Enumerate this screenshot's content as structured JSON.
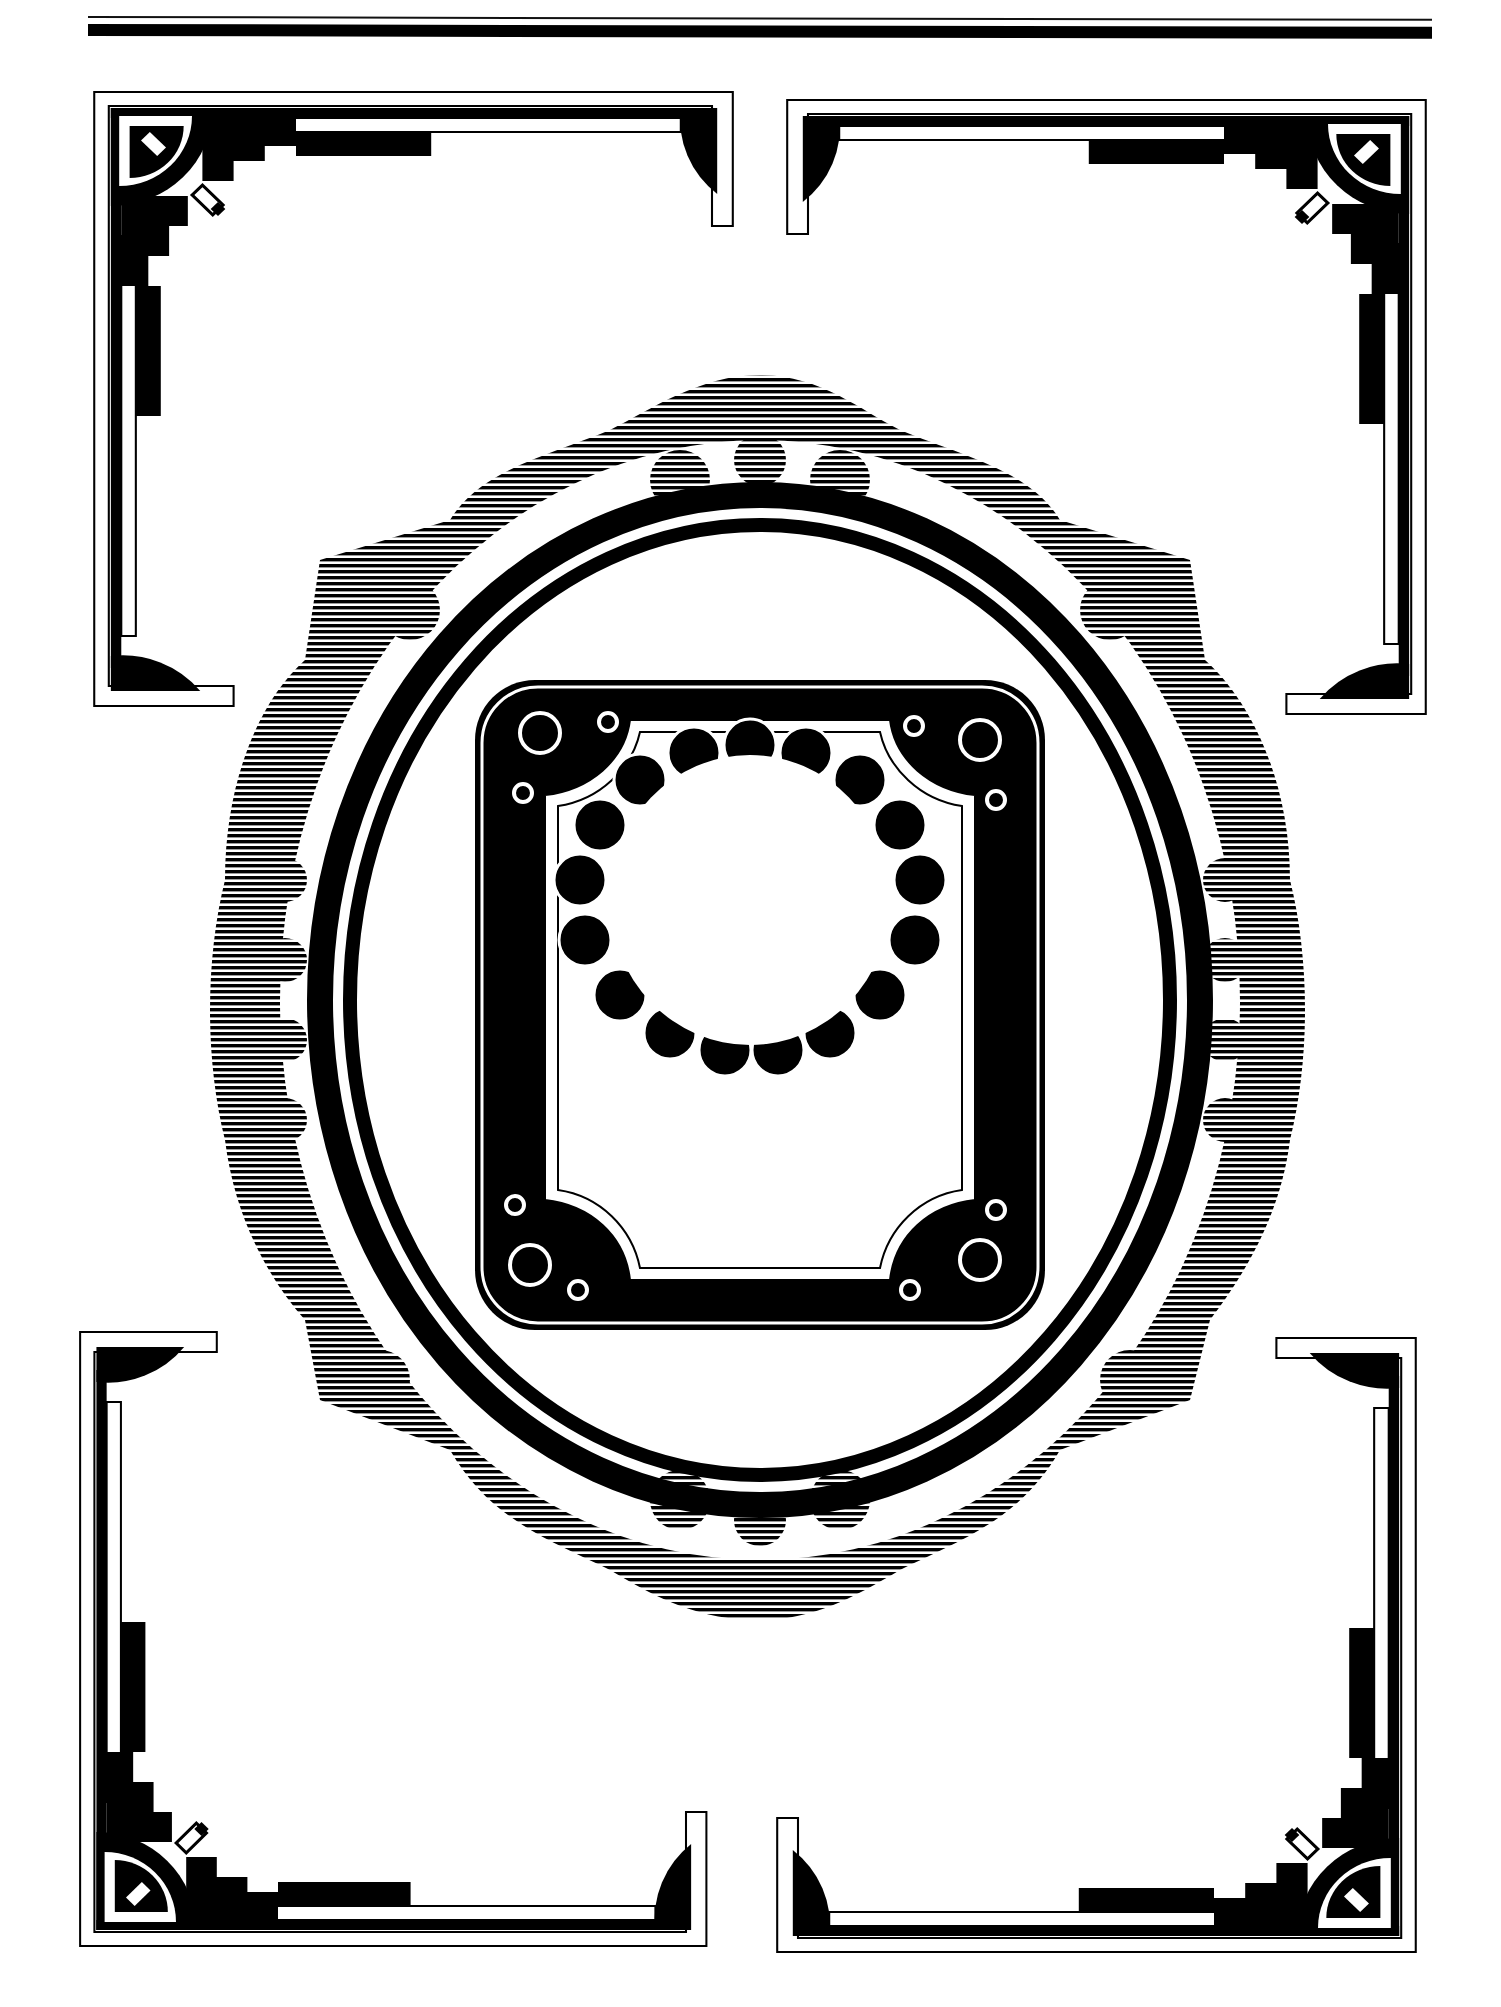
{
  "page": {
    "header_text": "",
    "page_number": "",
    "colors": {
      "ink": "#000000",
      "paper": "#ffffff"
    }
  },
  "elements": {
    "corner_frames": [
      "top-left",
      "top-right",
      "bottom-left",
      "bottom-right"
    ],
    "central_frame": "ornate-oval-with-hatched-scallops",
    "inner_frame": "square-frame-with-circle-corners",
    "innermost_frame": "scalloped-oval"
  }
}
